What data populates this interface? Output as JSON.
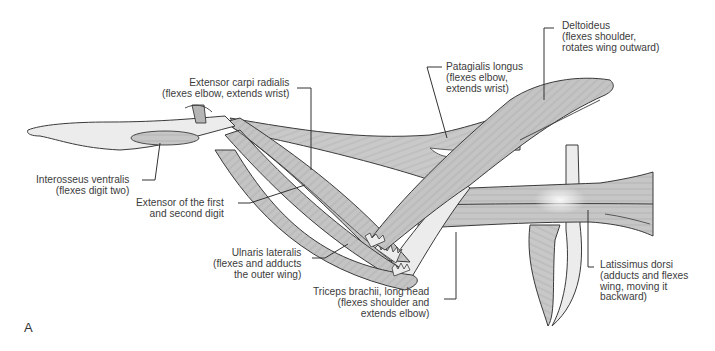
{
  "figure": {
    "panel_letter": "A",
    "colors": {
      "muscle_fill": "#c8c8c8",
      "muscle_stroke": "#3a3a3a",
      "bone_fill": "#ececec",
      "leader_line": "#333333",
      "background": "#ffffff"
    }
  },
  "labels": [
    {
      "id": "extensor-carpi-radialis",
      "name": "Extensor carpi radialis",
      "lines": [
        "Extensor carpi radialis",
        "(flexes elbow, extends wrist)"
      ]
    },
    {
      "id": "patagialis-longus",
      "name": "Patagialis longus",
      "lines": [
        "Patagialis longus",
        "(flexes elbow,",
        "extends wrist)"
      ]
    },
    {
      "id": "deltoideus",
      "name": "Deltoideus",
      "lines": [
        "Deltoideus",
        "(flexes shoulder,",
        "rotates wing outward)"
      ]
    },
    {
      "id": "interosseus-ventralis",
      "name": "Interosseus ventralis",
      "lines": [
        "Interosseus ventralis",
        "(flexes digit two)"
      ]
    },
    {
      "id": "extensor-first-second-digit",
      "name": "Extensor of the first and second digit",
      "lines": [
        "Extensor of the first",
        "and second digit"
      ]
    },
    {
      "id": "ulnaris-lateralis",
      "name": "Ulnaris lateralis",
      "lines": [
        "Ulnaris lateralis",
        "(flexes and adducts",
        "the outer wing)"
      ]
    },
    {
      "id": "triceps-brachii",
      "name": "Triceps brachii, long head",
      "lines": [
        "Triceps brachii, long head",
        "(flexes shoulder and",
        "extends elbow)"
      ]
    },
    {
      "id": "latissimus-dorsi",
      "name": "Latissimus dorsi",
      "lines": [
        "Latissimus dorsi",
        "(adducts and flexes",
        "wing, moving it",
        "backward)"
      ]
    }
  ]
}
